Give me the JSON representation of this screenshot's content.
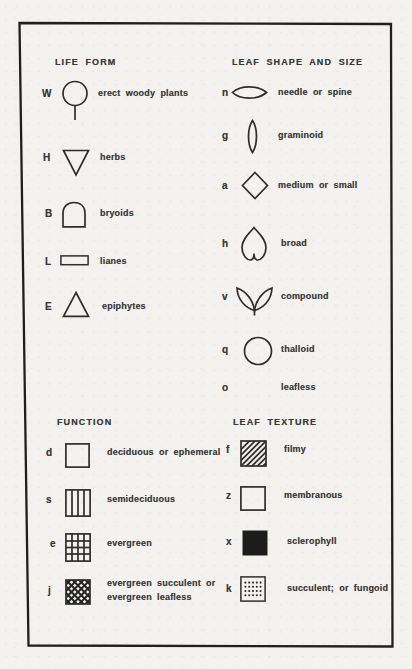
{
  "colors": {
    "paper": "#f3f2ee",
    "ink": "#383838",
    "border": "#1f1f1f",
    "symbol_stroke": "#2e2e2e",
    "solid_fill": "#1c1c1c"
  },
  "sections": {
    "life_form": {
      "title": "LIFE FORM",
      "items": [
        {
          "letter": "W",
          "symbol": "circle-with-stem",
          "label": "erect woody plants"
        },
        {
          "letter": "H",
          "symbol": "inverted-triangle",
          "label": "herbs"
        },
        {
          "letter": "B",
          "symbol": "dome",
          "label": "bryoids"
        },
        {
          "letter": "L",
          "symbol": "rectangle",
          "label": "lianes"
        },
        {
          "letter": "E",
          "symbol": "triangle",
          "label": "epiphytes"
        }
      ]
    },
    "leaf_shape": {
      "title": "LEAF SHAPE AND SIZE",
      "items": [
        {
          "letter": "n",
          "symbol": "horizontal-lens",
          "label": "needle or spine"
        },
        {
          "letter": "g",
          "symbol": "vertical-lens",
          "label": "graminoid"
        },
        {
          "letter": "a",
          "symbol": "diamond",
          "label": "medium or small"
        },
        {
          "letter": "h",
          "symbol": "inverted-heart",
          "label": "broad"
        },
        {
          "letter": "v",
          "symbol": "paired-leaflets",
          "label": "compound"
        },
        {
          "letter": "q",
          "symbol": "circle",
          "label": "thalloid"
        },
        {
          "letter": "o",
          "symbol": "none",
          "label": "leafless"
        }
      ]
    },
    "function": {
      "title": "FUNCTION",
      "items": [
        {
          "letter": "d",
          "symbol": "empty-square",
          "label": "deciduous or ephemeral"
        },
        {
          "letter": "s",
          "symbol": "vertical-stripes-square",
          "label": "semideciduous"
        },
        {
          "letter": "e",
          "symbol": "grid-square",
          "label": "evergreen"
        },
        {
          "letter": "j",
          "symbol": "crosshatch-square",
          "label_line1": "evergreen succulent or",
          "label_line2": "evergreen leafless"
        }
      ]
    },
    "leaf_texture": {
      "title": "LEAF TEXTURE",
      "items": [
        {
          "letter": "f",
          "symbol": "diagonal-hatch-square",
          "label": "filmy"
        },
        {
          "letter": "z",
          "symbol": "empty-square",
          "label": "membranous"
        },
        {
          "letter": "x",
          "symbol": "solid-black-square",
          "label": "sclerophyll"
        },
        {
          "letter": "k",
          "symbol": "dotted-square",
          "label": "succulent; or fungoid"
        }
      ]
    }
  }
}
